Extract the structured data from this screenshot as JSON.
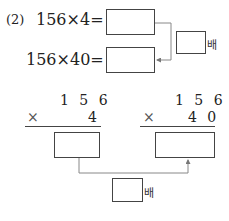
{
  "problem": {
    "number_label": "(2)",
    "equations": [
      {
        "expression": "156×4=",
        "answer": ""
      },
      {
        "expression": "156×40=",
        "answer": ""
      }
    ],
    "ratio_box": {
      "answer": "",
      "unit": "배"
    }
  },
  "vertical_calcs": [
    {
      "multiplicand": "1 5 6",
      "operator": "×",
      "multiplier": "4",
      "answer": ""
    },
    {
      "multiplicand": "1 5 6",
      "operator": "×",
      "multiplier": "4 0",
      "answer": ""
    }
  ],
  "bottom_ratio_box": {
    "answer": "",
    "unit": "배"
  },
  "colors": {
    "line": "#444444",
    "connector": "#888888",
    "text": "#222222"
  }
}
